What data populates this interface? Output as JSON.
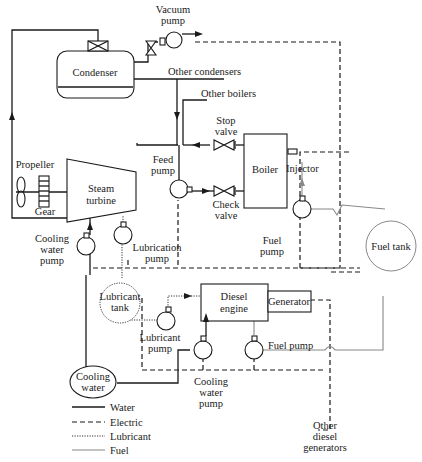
{
  "diagram": {
    "components": {
      "vacuum_pump": "Vacuum\npump",
      "vacuum_pump_l1": "Vacuum",
      "vacuum_pump_l2": "pump",
      "condenser": "Condenser",
      "other_condensers": "Other condensers",
      "other_boilers": "Other boilers",
      "stop_valve_l1": "Stop",
      "stop_valve_l2": "valve",
      "feed_pump_l1": "Feed",
      "feed_pump_l2": "pump",
      "boiler": "Boiler",
      "injector": "Injector",
      "check_valve_l1": "Check",
      "check_valve_l2": "valve",
      "propeller": "Propeller",
      "gear": "Gear",
      "steam_turbine_l1": "Steam",
      "steam_turbine_l2": "turbine",
      "cooling_water_pump_l1": "Cooling",
      "cooling_water_pump_l2": "water",
      "cooling_water_pump_l3": "pump",
      "lubrication_pump_l1": "Lubrication",
      "lubrication_pump_l2": "pump",
      "fuel_pump_l1": "Fuel",
      "fuel_pump_l2": "pump",
      "fuel_tank": "Fuel tank",
      "lubricant_tank_l1": "Lubricant",
      "lubricant_tank_l2": "tank",
      "diesel_engine_l1": "Diesel",
      "diesel_engine_l2": "engine",
      "generator": "Generator",
      "lubricant_pump_l1": "Lubricant",
      "lubricant_pump_l2": "pump",
      "diesel_fuel_pump": "Fuel pump",
      "diesel_cooling_pump_l1": "Cooling",
      "diesel_cooling_pump_l2": "water",
      "diesel_cooling_pump_l3": "pump",
      "cooling_water_l1": "Cooling",
      "cooling_water_l2": "water",
      "other_diesel_l1": "Other",
      "other_diesel_l2": "diesel",
      "other_diesel_l3": "generators"
    },
    "legend": [
      {
        "style": "solid",
        "label": "Water"
      },
      {
        "style": "dashed",
        "label": "Electric"
      },
      {
        "style": "dotted",
        "label": "Lubricant"
      },
      {
        "style": "thin-gray",
        "label": "Fuel"
      }
    ],
    "colors": {
      "line": "#1a1a1a",
      "fuel": "#888888",
      "background": "#ffffff"
    }
  }
}
